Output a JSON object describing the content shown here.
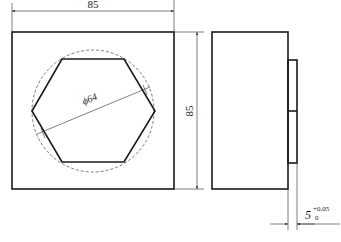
{
  "drawing": {
    "front_view": {
      "width_dim": "85",
      "height_dim": "85",
      "diameter_dim": "ϕ64"
    },
    "side_view": {
      "thickness_dim": "5",
      "tol_upper": "+0.05",
      "tol_lower": "0"
    }
  },
  "colors": {
    "line": "#1a1a1a"
  }
}
